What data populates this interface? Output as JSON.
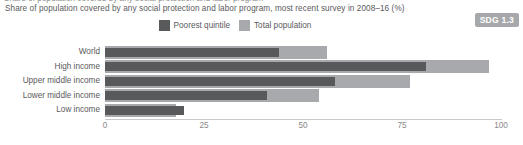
{
  "top_clipped_text": "Share of population covered by any social protection and labor program",
  "title": "Share of population covered by any social protection and labor program, most recent survey in 2008–16 (%)",
  "badge": {
    "label": "SDG 1.3",
    "color": "#a6a8ab"
  },
  "legend": {
    "position": "top-center",
    "items": [
      {
        "label": "Poorest quintile",
        "color": "#58595b",
        "icon": "legend-swatch-poorest"
      },
      {
        "label": "Total population",
        "color": "#a7a9ac",
        "icon": "legend-swatch-total"
      }
    ]
  },
  "axis": {
    "ticks": [
      "0",
      "25",
      "50",
      "75",
      "100"
    ],
    "tick_values": [
      0,
      25,
      50,
      75,
      100
    ],
    "min": 0,
    "max": 100
  },
  "chart_data": {
    "type": "bar",
    "orientation": "horizontal",
    "title": "Share of population covered by any social protection and labor program, most recent survey in 2008–16 (%)",
    "xlabel": "",
    "ylabel": "",
    "xlim": [
      0,
      100
    ],
    "grid": false,
    "legend_position": "top-center",
    "categories": [
      "World",
      "High income",
      "Upper middle income",
      "Lower middle income",
      "Low income"
    ],
    "series": [
      {
        "name": "Poorest quintile",
        "color": "#58595b",
        "values": [
          44,
          81,
          58,
          41,
          20
        ]
      },
      {
        "name": "Total population",
        "color": "#a7a9ac",
        "values": [
          56,
          97,
          77,
          54,
          18
        ]
      }
    ]
  }
}
